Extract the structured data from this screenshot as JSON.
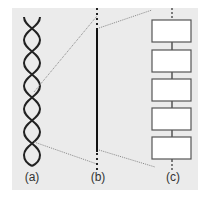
{
  "diagram": {
    "labels": {
      "a": "(a)",
      "b": "(b)",
      "c": "(c)"
    },
    "panels": [
      {
        "id": "a",
        "depicts": "double-helix"
      },
      {
        "id": "b",
        "depicts": "single-line"
      },
      {
        "id": "c",
        "depicts": "stack-of-boxes",
        "box_count": 5
      }
    ],
    "colors": {
      "background": "#ebebeb",
      "stroke": "#222222",
      "dotted": "#888888",
      "box_fill": "#ffffff"
    }
  }
}
